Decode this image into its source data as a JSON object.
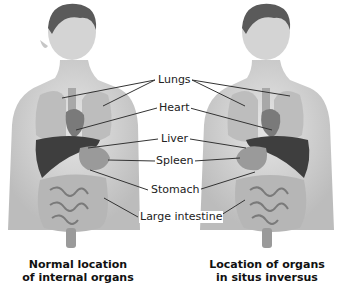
{
  "figure": {
    "left_figure": {
      "caption_line1": "Normal location",
      "caption_line2": "of internal organs"
    },
    "right_figure": {
      "caption_line1": "Location of organs",
      "caption_line2": "in situs inversus"
    },
    "labels": [
      {
        "id": "lungs",
        "text": "Lungs"
      },
      {
        "id": "heart",
        "text": "Heart"
      },
      {
        "id": "liver",
        "text": "Liver"
      },
      {
        "id": "spleen",
        "text": "Spleen"
      },
      {
        "id": "stomach",
        "text": "Stomach"
      },
      {
        "id": "large_intestine",
        "text": "Large intestine"
      }
    ],
    "colors": {
      "skin": "#d9d9d9",
      "skin_shadow": "#bdbdbd",
      "hair": "#555555",
      "organ_dark": "#3a3a3a",
      "organ_mid": "#8a8a8a",
      "organ_light": "#c4c4c4",
      "leader_line": "#333333"
    }
  }
}
